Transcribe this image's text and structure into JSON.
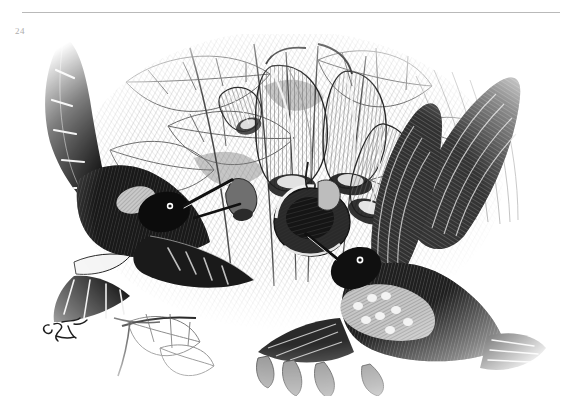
{
  "page": {
    "folio": "24",
    "background_color": "#ffffff",
    "rule_color": "#b9b9b9",
    "folio_color": "#adadad"
  },
  "plate": {
    "medium": "wood engraving",
    "palette": {
      "ink": "#121212",
      "mid_tone": "#6e6e6e",
      "light_tone": "#b5b5b5",
      "paper": "#ffffff"
    },
    "subjects": [
      {
        "name": "hummingbird-left-perched",
        "description": "dark hummingbird with long straight bill, tail fanned, perched at upper left",
        "tone": "very dark"
      },
      {
        "name": "hummingbird-right-hovering",
        "description": "hummingbird in flight with both wings raised and spread, tail fanned, at lower right",
        "tone": "dark with light breast"
      },
      {
        "name": "flower-cluster",
        "description": "pendulous trumpet-shaped blossoms hanging from branch at centre",
        "count": 6
      },
      {
        "name": "foliage-backdrop",
        "description": "large veined leaves and stems filling the background",
        "tone": "light grey cross-hatching"
      }
    ],
    "signature": {
      "name": "engraver-monogram",
      "legible": false,
      "position": "lower-left"
    }
  }
}
